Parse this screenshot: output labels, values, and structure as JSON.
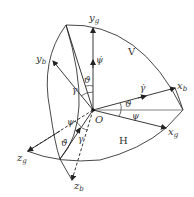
{
  "diagram": {
    "origin_label": "O",
    "plane_labels": {
      "vertical": "V",
      "horizontal": "H"
    },
    "axes": {
      "yg": {
        "base": "y",
        "sub": "g"
      },
      "yb": {
        "base": "y",
        "sub": "b"
      },
      "xb": {
        "base": "x",
        "sub": "b"
      },
      "xg": {
        "base": "x",
        "sub": "g"
      },
      "zg": {
        "base": "z",
        "sub": "g"
      },
      "zb": {
        "base": "z",
        "sub": "b"
      }
    },
    "angles": {
      "theta_upper": "ϑ",
      "gamma_upper": "γ",
      "psi_dot": "ψ̇",
      "gamma_dot": "γ̇",
      "theta_right": "ϑ",
      "psi_right": "ψ",
      "psi_lower": "ψ",
      "theta_dot_lower": "ϑ̇",
      "gamma_lower": "γ"
    },
    "colors": {
      "line": "#333333",
      "background": "#ffffff"
    }
  }
}
